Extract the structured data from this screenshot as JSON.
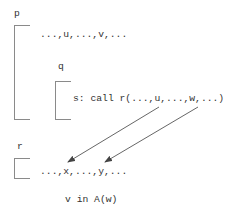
{
  "procedures": {
    "p": {
      "label": "p",
      "vars": "...,u,...,v,..."
    },
    "q": {
      "label": "q",
      "statement": "s: call r(...,u,...,w,...)"
    },
    "r": {
      "label": "r",
      "params": "...,x,...,y,..."
    }
  },
  "arrows": [
    {
      "from": "u",
      "to": "x"
    },
    {
      "from": "w",
      "to": "y"
    }
  ],
  "caption": "v in A(w)",
  "colors": {
    "text": "#333333",
    "bracket": "#8a8a8a",
    "arrow": "#555555"
  }
}
